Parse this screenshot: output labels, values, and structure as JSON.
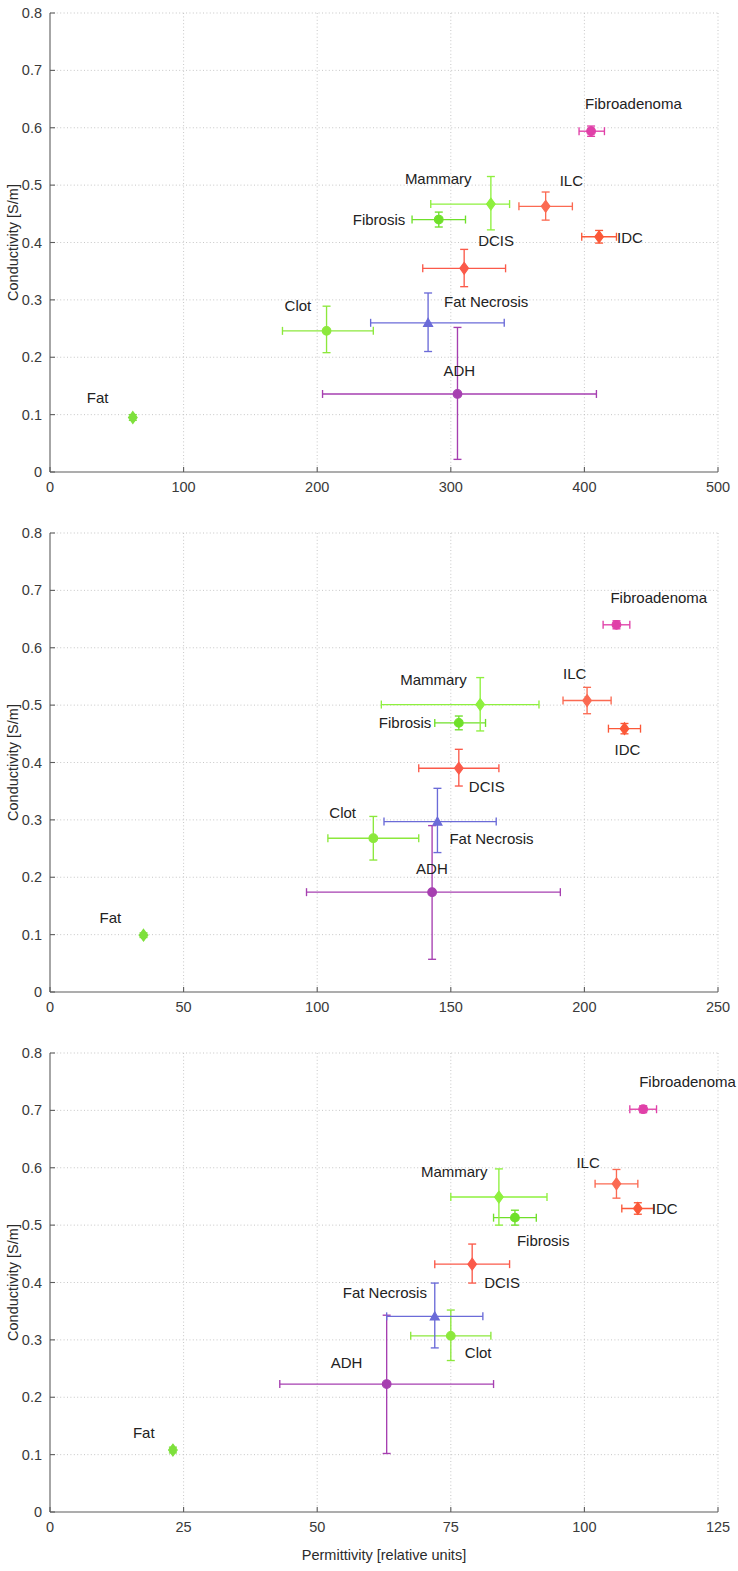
{
  "figure": {
    "panel_count": 3,
    "shared_ylabel": "Conductivity [S/m]",
    "shared_xlabel": "Permittivity [relative units]"
  },
  "series_colors": {
    "Fat": "#7ee03c",
    "Clot": "#8ce83c",
    "Fibrosis": "#6fe02a",
    "Mammary": "#8ef03e",
    "Fat Necrosis": "#6b6bd8",
    "ADH": "#a63fb0",
    "DCIS": "#fb5a4a",
    "ILC": "#fb6a52",
    "IDC": "#fb5838",
    "Fibroadenoma": "#e040a8"
  },
  "series_markers": {
    "Fat": "diamond",
    "Clot": "circle",
    "Fibrosis": "circle",
    "Mammary": "diamond",
    "Fat Necrosis": "triangle",
    "ADH": "circle",
    "DCIS": "diamond",
    "ILC": "diamond",
    "IDC": "diamond",
    "Fibroadenoma": "circle"
  },
  "chart_data": [
    {
      "type": "scatter",
      "panel_index": 0,
      "title": "",
      "xlabel": "",
      "ylabel": "Conductivity [S/m]",
      "xlim": [
        0,
        500
      ],
      "ylim": [
        0,
        0.8
      ],
      "xticks": [
        0,
        100,
        200,
        300,
        400,
        500
      ],
      "yticks": [
        0,
        0.1,
        0.2,
        0.3,
        0.4,
        0.5,
        0.6,
        0.7,
        0.8
      ],
      "xtick_labels": [
        "0",
        "100",
        "200",
        "300",
        "400",
        "500"
      ],
      "ytick_labels": [
        "0",
        "0.1",
        "0.2",
        "0.3",
        "0.4",
        "0.5",
        "0.6",
        "0.7",
        "0.8"
      ],
      "grid": true,
      "legend": "none",
      "points": [
        {
          "name": "Fat",
          "x": 62,
          "y": 0.095,
          "xerr_lo": 0,
          "xerr_hi": 0,
          "yerr_lo": 0.005,
          "yerr_hi": 0.005,
          "label_dx": -46,
          "label_dy": -14
        },
        {
          "name": "Clot",
          "x": 207,
          "y": 0.246,
          "xerr_lo": 33,
          "xerr_hi": 35,
          "yerr_lo": 0.038,
          "yerr_hi": 0.043,
          "label_dx": -42,
          "label_dy": -20
        },
        {
          "name": "ADH",
          "x": 305,
          "y": 0.136,
          "xerr_lo": 101,
          "xerr_hi": 104,
          "yerr_lo": 0.114,
          "yerr_hi": 0.116,
          "label_dx": -14,
          "label_dy": -18
        },
        {
          "name": "Fat Necrosis",
          "x": 283,
          "y": 0.26,
          "xerr_lo": 43,
          "xerr_hi": 57,
          "yerr_lo": 0.05,
          "yerr_hi": 0.052,
          "label_dx": 16,
          "label_dy": -16
        },
        {
          "name": "DCIS",
          "x": 310,
          "y": 0.355,
          "xerr_lo": 31,
          "xerr_hi": 31,
          "yerr_lo": 0.032,
          "yerr_hi": 0.033,
          "label_dx": 14,
          "label_dy": -22
        },
        {
          "name": "Fibrosis",
          "x": 291,
          "y": 0.44,
          "xerr_lo": 20,
          "xerr_hi": 20,
          "yerr_lo": 0.013,
          "yerr_hi": 0.013,
          "label_dx": -86,
          "label_dy": 5
        },
        {
          "name": "Mammary",
          "x": 330,
          "y": 0.467,
          "xerr_lo": 45,
          "xerr_hi": 14,
          "yerr_lo": 0.045,
          "yerr_hi": 0.048,
          "label_dx": -86,
          "label_dy": -20
        },
        {
          "name": "ILC",
          "x": 371,
          "y": 0.463,
          "xerr_lo": 20,
          "xerr_hi": 20,
          "yerr_lo": 0.024,
          "yerr_hi": 0.025,
          "label_dx": 14,
          "label_dy": -20
        },
        {
          "name": "IDC",
          "x": 411,
          "y": 0.41,
          "xerr_lo": 13,
          "xerr_hi": 13,
          "yerr_lo": 0.011,
          "yerr_hi": 0.011,
          "label_dx": 18,
          "label_dy": 6
        },
        {
          "name": "Fibroadenoma",
          "x": 405,
          "y": 0.594,
          "xerr_lo": 9,
          "xerr_hi": 10,
          "yerr_lo": 0.009,
          "yerr_hi": 0.009,
          "label_dx": -6,
          "label_dy": -22
        }
      ]
    },
    {
      "type": "scatter",
      "panel_index": 1,
      "title": "",
      "xlabel": "",
      "ylabel": "Conductivity [S/m]",
      "xlim": [
        0,
        250
      ],
      "ylim": [
        0,
        0.8
      ],
      "xticks": [
        0,
        50,
        100,
        150,
        200,
        250
      ],
      "yticks": [
        0,
        0.1,
        0.2,
        0.3,
        0.4,
        0.5,
        0.6,
        0.7,
        0.8
      ],
      "xtick_labels": [
        "0",
        "50",
        "100",
        "150",
        "200",
        "250"
      ],
      "ytick_labels": [
        "0",
        "0.1",
        "0.2",
        "0.3",
        "0.4",
        "0.5",
        "0.6",
        "0.7",
        "0.8"
      ],
      "grid": true,
      "legend": "none",
      "points": [
        {
          "name": "Fat",
          "x": 35,
          "y": 0.099,
          "xerr_lo": 0,
          "xerr_hi": 0,
          "yerr_lo": 0.004,
          "yerr_hi": 0.004,
          "label_dx": -44,
          "label_dy": -12
        },
        {
          "name": "Clot",
          "x": 121,
          "y": 0.268,
          "xerr_lo": 17,
          "xerr_hi": 17,
          "yerr_lo": 0.038,
          "yerr_hi": 0.038,
          "label_dx": -44,
          "label_dy": -20
        },
        {
          "name": "ADH",
          "x": 143,
          "y": 0.174,
          "xerr_lo": 47,
          "xerr_hi": 48,
          "yerr_lo": 0.117,
          "yerr_hi": 0.116,
          "label_dx": -16,
          "label_dy": -18
        },
        {
          "name": "Fat Necrosis",
          "x": 145,
          "y": 0.297,
          "xerr_lo": 20,
          "xerr_hi": 22,
          "yerr_lo": 0.054,
          "yerr_hi": 0.058,
          "label_dx": 12,
          "label_dy": 22
        },
        {
          "name": "DCIS",
          "x": 153,
          "y": 0.39,
          "xerr_lo": 15,
          "xerr_hi": 15,
          "yerr_lo": 0.031,
          "yerr_hi": 0.033,
          "label_dx": 10,
          "label_dy": 24
        },
        {
          "name": "Fibrosis",
          "x": 153,
          "y": 0.469,
          "xerr_lo": 9,
          "xerr_hi": 10,
          "yerr_lo": 0.012,
          "yerr_hi": 0.012,
          "label_dx": -80,
          "label_dy": 5
        },
        {
          "name": "Mammary",
          "x": 161,
          "y": 0.501,
          "xerr_lo": 37,
          "xerr_hi": 22,
          "yerr_lo": 0.046,
          "yerr_hi": 0.047,
          "label_dx": -80,
          "label_dy": -20
        },
        {
          "name": "ILC",
          "x": 201,
          "y": 0.508,
          "xerr_lo": 9,
          "xerr_hi": 9,
          "yerr_lo": 0.023,
          "yerr_hi": 0.023,
          "label_dx": -24,
          "label_dy": -22
        },
        {
          "name": "IDC",
          "x": 215,
          "y": 0.459,
          "xerr_lo": 6,
          "xerr_hi": 6,
          "yerr_lo": 0.009,
          "yerr_hi": 0.009,
          "label_dx": -10,
          "label_dy": 26
        },
        {
          "name": "Fibroadenoma",
          "x": 212,
          "y": 0.64,
          "xerr_lo": 5,
          "xerr_hi": 5,
          "yerr_lo": 0.007,
          "yerr_hi": 0.007,
          "label_dx": -6,
          "label_dy": -22
        }
      ]
    },
    {
      "type": "scatter",
      "panel_index": 2,
      "title": "",
      "xlabel": "Permittivity [relative units]",
      "ylabel": "Conductivity [S/m]",
      "xlim": [
        0,
        125
      ],
      "ylim": [
        0,
        0.8
      ],
      "xticks": [
        0,
        25,
        50,
        75,
        100,
        125
      ],
      "yticks": [
        0,
        0.1,
        0.2,
        0.3,
        0.4,
        0.5,
        0.6,
        0.7,
        0.8
      ],
      "xtick_labels": [
        "0",
        "25",
        "50",
        "75",
        "100",
        "125"
      ],
      "ytick_labels": [
        "0",
        "0.1",
        "0.2",
        "0.3",
        "0.4",
        "0.5",
        "0.6",
        "0.7",
        "0.8"
      ],
      "grid": true,
      "legend": "none",
      "points": [
        {
          "name": "Fat",
          "x": 23,
          "y": 0.108,
          "xerr_lo": 0,
          "xerr_hi": 0,
          "yerr_lo": 0.005,
          "yerr_hi": 0.005,
          "label_dx": -40,
          "label_dy": -12
        },
        {
          "name": "Clot",
          "x": 75,
          "y": 0.307,
          "xerr_lo": 7.5,
          "xerr_hi": 7.5,
          "yerr_lo": 0.043,
          "yerr_hi": 0.045,
          "label_dx": 14,
          "label_dy": 22
        },
        {
          "name": "ADH",
          "x": 63,
          "y": 0.223,
          "xerr_lo": 20,
          "xerr_hi": 20,
          "yerr_lo": 0.121,
          "yerr_hi": 0.12,
          "label_dx": -56,
          "label_dy": -16
        },
        {
          "name": "Fat Necrosis",
          "x": 72,
          "y": 0.341,
          "xerr_lo": 9,
          "xerr_hi": 9,
          "yerr_lo": 0.055,
          "yerr_hi": 0.058,
          "label_dx": -92,
          "label_dy": -18
        },
        {
          "name": "DCIS",
          "x": 79,
          "y": 0.432,
          "xerr_lo": 7,
          "xerr_hi": 7,
          "yerr_lo": 0.033,
          "yerr_hi": 0.035,
          "label_dx": 12,
          "label_dy": 24
        },
        {
          "name": "Fibrosis",
          "x": 87,
          "y": 0.513,
          "xerr_lo": 4,
          "xerr_hi": 4,
          "yerr_lo": 0.013,
          "yerr_hi": 0.013,
          "label_dx": 2,
          "label_dy": 28
        },
        {
          "name": "Mammary",
          "x": 84,
          "y": 0.549,
          "xerr_lo": 9,
          "xerr_hi": 9,
          "yerr_lo": 0.049,
          "yerr_hi": 0.049,
          "label_dx": -78,
          "label_dy": -20
        },
        {
          "name": "ILC",
          "x": 106,
          "y": 0.572,
          "xerr_lo": 4,
          "xerr_hi": 4,
          "yerr_lo": 0.025,
          "yerr_hi": 0.025,
          "label_dx": -40,
          "label_dy": -16
        },
        {
          "name": "IDC",
          "x": 110,
          "y": 0.529,
          "xerr_lo": 3,
          "xerr_hi": 3,
          "yerr_lo": 0.01,
          "yerr_hi": 0.01,
          "label_dx": 14,
          "label_dy": 6
        },
        {
          "name": "Fibroadenoma",
          "x": 111,
          "y": 0.702,
          "xerr_lo": 2.5,
          "xerr_hi": 2.5,
          "yerr_lo": 0.006,
          "yerr_hi": 0.006,
          "label_dx": -4,
          "label_dy": -22
        }
      ]
    }
  ]
}
